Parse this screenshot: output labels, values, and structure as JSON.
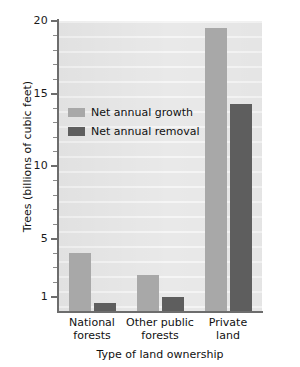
{
  "chart_data": {
    "type": "bar",
    "title": "",
    "xlabel": "Type of land ownership",
    "ylabel": "Trees (billions of cubic feet)",
    "categories": [
      "National forests",
      "Other public forests",
      "Private land"
    ],
    "series": [
      {
        "name": "Net annual growth",
        "color": "#a8a8a8",
        "values": [
          4.0,
          2.5,
          19.5
        ]
      },
      {
        "name": "Net annual removal",
        "color": "#5e5e5e",
        "values": [
          0.55,
          1.0,
          14.3
        ]
      }
    ],
    "ylim": [
      0,
      20
    ],
    "yticks": [
      1,
      5,
      10,
      15,
      20
    ],
    "ytick_labels": [
      "1",
      "5",
      "10",
      "15",
      "20"
    ],
    "yminor_step": 1,
    "grid": "horizontal-bands",
    "legend_position": "inside-upper-left",
    "plot_background": "#e9e9e9"
  },
  "axis": {
    "y_title": "Trees (billions of cubic feet)",
    "x_title": "Type of land ownership",
    "y_labels": [
      "20",
      "15",
      "10",
      "5",
      "1"
    ]
  },
  "categories": [
    {
      "line1": "National",
      "line2": "forests"
    },
    {
      "line1": "Other public",
      "line2": "forests"
    },
    {
      "line1": "Private",
      "line2": "land"
    }
  ],
  "legend": {
    "items": [
      {
        "label": "Net annual growth",
        "swatch": "growth-swatch"
      },
      {
        "label": "Net annual removal",
        "swatch": "removal-swatch"
      }
    ]
  }
}
